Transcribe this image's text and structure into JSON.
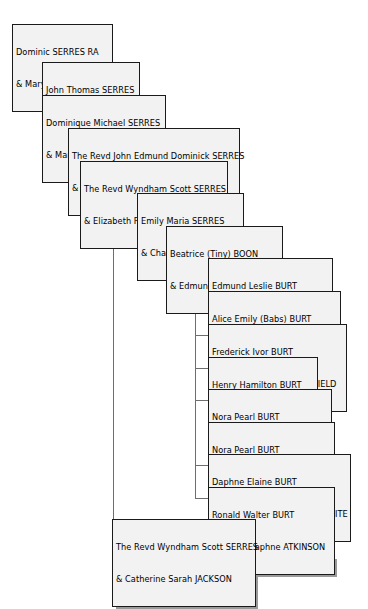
{
  "document": {
    "type": "genealogy-family-tree",
    "title": "Serres / Boon / Burt descendant chart",
    "surname_focus": "SERRES"
  },
  "style": {
    "box_fill": "#f2f2f2",
    "box_border": "#1a1a1a",
    "box_shadow": "#9a9a9a",
    "line_color": "#6e6e6e",
    "text_color": "#000000",
    "page_background": "#ffffff"
  },
  "nodes": [
    {
      "id": "n1",
      "generation": 1,
      "person": "Dominic SERRES RA",
      "spouse": "& Mary CALDECOTT",
      "x": 12,
      "y": 24,
      "w": 101
    },
    {
      "id": "n2",
      "generation": 2,
      "person": "John Thomas SERRES",
      "spouse": "& Olivia WILMOT",
      "x": 42,
      "y": 62,
      "w": 98
    },
    {
      "id": "n3",
      "generation": 2,
      "person": "Dominique Michael SERRES",
      "spouse": "& Maria  Lucretia MADDAN",
      "x": 42,
      "y": 95,
      "w": 124
    },
    {
      "id": "n4",
      "generation": 3,
      "person": "The Revd John Edmund Dominick SERRES",
      "spouse": "& Elizabeth MADDEN",
      "x": 68,
      "y": 128,
      "w": 172
    },
    {
      "id": "n5",
      "generation": 4,
      "person": "The Revd Wyndham Scott SERRES",
      "spouse": "& Elizabeth ROBERTSON",
      "x": 80,
      "y": 161,
      "w": 148
    },
    {
      "id": "n6",
      "generation": 5,
      "person": "Emily Maria SERRES",
      "spouse": "& Charles Henry BOON",
      "x": 137,
      "y": 193,
      "w": 107
    },
    {
      "id": "n7",
      "generation": 6,
      "person": "Beatrice (Tiny) BOON",
      "spouse": "& Edmund Alfred BURT",
      "x": 166,
      "y": 226,
      "w": 117
    },
    {
      "id": "n8",
      "generation": 7,
      "person": "Edmund Leslie BURT",
      "spouse": "& Sally Walrond BICKFORD",
      "x": 208,
      "y": 258,
      "w": 125
    },
    {
      "id": "n9",
      "generation": 7,
      "person": "Alice Emily (Babs) BURT",
      "spouse": "& Frederick William HOBBINS",
      "x": 208,
      "y": 291,
      "w": 133
    },
    {
      "id": "n10",
      "generation": 7,
      "person": "Frederick Ivor BURT",
      "spouse": "& Phyllis Dorothy WHITEFIELD",
      "x": 208,
      "y": 324,
      "w": 139
    },
    {
      "id": "n11",
      "generation": 7,
      "person": "Henry Hamilton BURT",
      "spouse": "& Margaret LAMBERT",
      "x": 208,
      "y": 357,
      "w": 110
    },
    {
      "id": "n12",
      "generation": 7,
      "person": "Nora Pearl BURT",
      "spouse": "& Harry Evered GRIMMON",
      "x": 208,
      "y": 389,
      "w": 124
    },
    {
      "id": "n13",
      "generation": 7,
      "person": "Nora Pearl BURT",
      "spouse": "& Harold Edmund BARTMAN",
      "x": 208,
      "y": 422,
      "w": 127
    },
    {
      "id": "n14",
      "generation": 7,
      "person": "Daphne Elaine BURT",
      "spouse": "& Charles Dermot GROVE-WHITE",
      "x": 208,
      "y": 454,
      "w": 143
    },
    {
      "id": "n15",
      "generation": 7,
      "person": "Ronald Walter BURT",
      "spouse": "& Gloria Daphne ATKINSON",
      "x": 208,
      "y": 487,
      "w": 127
    },
    {
      "id": "n16",
      "generation": 5,
      "person": "The Revd Wyndham Scott SERRES",
      "spouse": "& Catherine Sarah JACKSON",
      "x": 112,
      "y": 519,
      "w": 144
    }
  ],
  "connectors": [
    {
      "from": "n1",
      "to": "n2",
      "stem_x": 23,
      "top": 50,
      "bottom": 73,
      "right": 42
    },
    {
      "from": "n1",
      "to": "n3",
      "stem_x": 23,
      "top": 50,
      "bottom": 106,
      "right": 42
    },
    {
      "from": "n3",
      "to": "n4",
      "stem_x": 53,
      "top": 118,
      "bottom": 139,
      "right": 68
    },
    {
      "from": "n4",
      "to": "n5",
      "stem_x": 79,
      "top": 151,
      "bottom": 172,
      "right": 80
    },
    {
      "from": "n5",
      "to": "n6",
      "stem_x": 123,
      "top": 184,
      "bottom": 204,
      "right": 137
    },
    {
      "from": "n6",
      "to": "n7",
      "stem_x": 152,
      "top": 216,
      "bottom": 237,
      "right": 166
    },
    {
      "from": "n7",
      "to": "rail",
      "stem_x": 195,
      "top": 249,
      "bottom": 498,
      "right": 208
    },
    {
      "from": "n12",
      "to": "n13",
      "stem_x": 222,
      "top": 411,
      "bottom": 433,
      "right": 208
    },
    {
      "from": "n5",
      "to": "n16",
      "stem_x": 122,
      "top": 184,
      "bottom": 530,
      "right": 112
    }
  ]
}
